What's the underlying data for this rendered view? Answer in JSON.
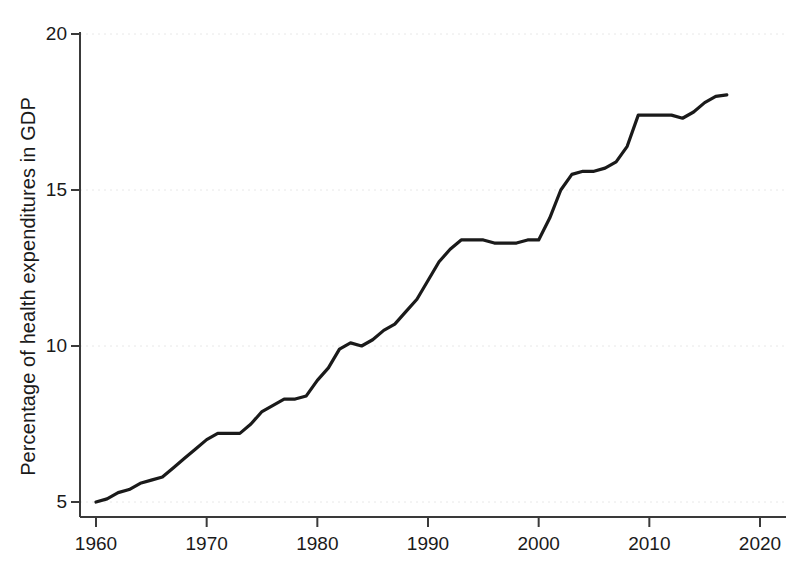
{
  "chart_data": {
    "type": "line",
    "title": "",
    "subtitle": "",
    "xlabel": "",
    "ylabel": "Percentage of health expenditures in GDP",
    "xlim": [
      1958,
      2021
    ],
    "ylim": [
      4.3,
      20.6
    ],
    "xticks": [
      1960,
      1970,
      1980,
      1990,
      2000,
      2010,
      2020
    ],
    "xtick_labels": [
      "1960",
      "1970",
      "1980",
      "1990",
      "2000",
      "2010",
      "2020"
    ],
    "yticks": [
      5,
      10,
      15,
      20
    ],
    "ytick_labels": [
      "5",
      "10",
      "15",
      "20"
    ],
    "grid": "horizontal-dotted-faint",
    "legend": "none",
    "line_color": "#1a1a1a",
    "line_width": 3.2,
    "grid_color": "#e8e8e8",
    "axis_color": "#3a3a3a",
    "background": "#ffffff",
    "series": [
      {
        "name": "Health expenditures share of GDP",
        "x": [
          1960,
          1961,
          1962,
          1963,
          1964,
          1965,
          1966,
          1967,
          1968,
          1969,
          1970,
          1971,
          1972,
          1973,
          1974,
          1975,
          1976,
          1977,
          1978,
          1979,
          1980,
          1981,
          1982,
          1983,
          1984,
          1985,
          1986,
          1987,
          1988,
          1989,
          1990,
          1991,
          1992,
          1993,
          1994,
          1995,
          1996,
          1997,
          1998,
          1999,
          2000,
          2001,
          2002,
          2003,
          2004,
          2005,
          2006,
          2007,
          2008,
          2009,
          2010,
          2011,
          2012,
          2013,
          2014,
          2015,
          2016,
          2017
        ],
        "values": [
          5.0,
          5.1,
          5.3,
          5.4,
          5.6,
          5.7,
          5.8,
          6.1,
          6.4,
          6.7,
          7.0,
          7.2,
          7.2,
          7.2,
          7.5,
          7.9,
          8.1,
          8.3,
          8.3,
          8.4,
          8.9,
          9.3,
          9.9,
          10.1,
          10.0,
          10.2,
          10.5,
          10.7,
          11.1,
          11.5,
          12.1,
          12.7,
          13.1,
          13.4,
          13.4,
          13.4,
          13.3,
          13.3,
          13.3,
          13.4,
          13.4,
          14.1,
          15.0,
          15.5,
          15.6,
          15.6,
          15.7,
          15.9,
          16.4,
          17.4,
          17.4,
          17.4,
          17.4,
          17.3,
          17.5,
          17.8,
          18.0,
          18.05
        ]
      }
    ]
  },
  "axis": {
    "y_title": "Percentage of health expenditures in GDP"
  }
}
